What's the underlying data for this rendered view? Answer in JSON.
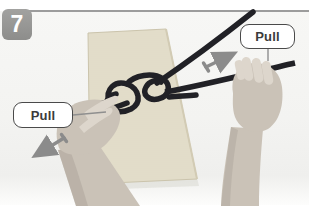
{
  "step": {
    "number": "7"
  },
  "labels": {
    "pull_left": "Pull",
    "pull_right": "Pull"
  },
  "scene": {
    "description": "Two hands pulling the ends of a square knot tied around a rope-wrapped canvas book",
    "objects": [
      "canvas-book",
      "square-knot-rope",
      "left-hand-pulling-down-left",
      "right-hand-pulling-right"
    ]
  },
  "icons": {
    "arrow_left": "direction-arrow-down-left",
    "arrow_right": "direction-arrow-up-right"
  },
  "colors": {
    "frame_line": "#9c9c9c",
    "badge_bg": "#979795",
    "badge_text": "#ffffff",
    "rope": "#212126",
    "book_fill": "#e7e1cf",
    "book_line": "#d9d2bc",
    "book_edge": "#cbc4ac",
    "skin": "#cac2b7",
    "skin_shadow": "#a8a096",
    "skin_light": "#ddd6cc",
    "arrow": "#8b8b8b",
    "connector": "#8f8f8f",
    "label_border": "#4a4a4a",
    "label_text": "#3b3b3b",
    "label_bg": "#ffffff"
  }
}
